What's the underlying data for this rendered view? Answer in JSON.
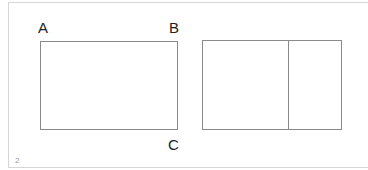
{
  "diagram": {
    "left_figure": {
      "labels": {
        "top_left": "A",
        "top_right": "B",
        "bottom_right": "C"
      },
      "shape": "rectangle"
    },
    "right_figure": {
      "shape": "rectangle",
      "divided": true,
      "divisions": 2
    },
    "colors": {
      "stroke": "#8a8a8a",
      "label": "#222222",
      "frame": "#d6d6d6"
    }
  },
  "page": {
    "number": "2"
  }
}
